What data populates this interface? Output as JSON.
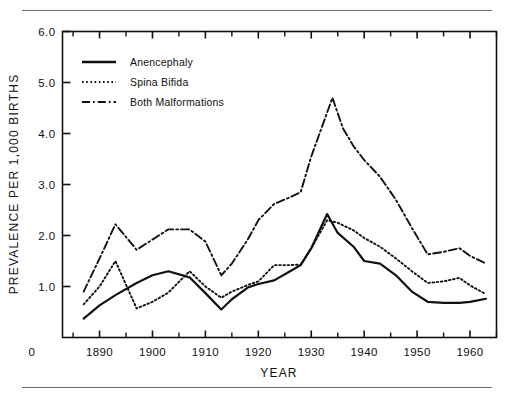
{
  "figure": {
    "background_color": "#ffffff",
    "ink_color": "#111111",
    "rule_color": "#6b6b6b",
    "top_rule": "horizontal-rule",
    "bottom_rule": "horizontal-rule"
  },
  "chart_data": {
    "type": "line",
    "title": "",
    "xlabel": "YEAR",
    "ylabel": "PREVALENCE PER 1,000 BIRTHS",
    "xlim": [
      1883,
      1965
    ],
    "ylim": [
      0,
      6.0
    ],
    "grid": false,
    "legend_position": "top-left",
    "x_tick_labels": [
      "1890",
      "1900",
      "1910",
      "1920",
      "1930",
      "1940",
      "1950",
      "1960"
    ],
    "x_major_ticks": [
      1890,
      1900,
      1910,
      1920,
      1930,
      1940,
      1950,
      1960
    ],
    "x_minor_ticks": [
      1885,
      1895,
      1905,
      1915,
      1925,
      1935,
      1945,
      1955,
      1965
    ],
    "y_tick_labels": [
      "1.0",
      "2.0",
      "3.0",
      "4.0",
      "5.0",
      "6.0"
    ],
    "y_ticks": [
      1.0,
      2.0,
      3.0,
      4.0,
      5.0,
      6.0
    ],
    "origin_label": "0",
    "series": [
      {
        "name": "Anencephaly",
        "style": "solid",
        "x": [
          1887,
          1890,
          1893,
          1897,
          1900,
          1903,
          1907,
          1910,
          1913,
          1915,
          1918,
          1920,
          1923,
          1926,
          1928,
          1930,
          1933,
          1935,
          1938,
          1940,
          1943,
          1946,
          1949,
          1952,
          1955,
          1958,
          1960,
          1963
        ],
        "values": [
          0.37,
          0.63,
          0.83,
          1.07,
          1.22,
          1.3,
          1.18,
          0.87,
          0.55,
          0.75,
          0.98,
          1.05,
          1.12,
          1.3,
          1.42,
          1.75,
          2.42,
          2.05,
          1.78,
          1.5,
          1.45,
          1.22,
          0.9,
          0.7,
          0.68,
          0.68,
          0.7,
          0.76
        ]
      },
      {
        "name": "Spina  Bifida",
        "style": "dotted",
        "x": [
          1887,
          1890,
          1893,
          1897,
          1900,
          1903,
          1907,
          1910,
          1913,
          1915,
          1918,
          1920,
          1923,
          1926,
          1928,
          1930,
          1933,
          1935,
          1938,
          1940,
          1943,
          1946,
          1949,
          1952,
          1955,
          1958,
          1960,
          1963
        ],
        "values": [
          0.65,
          1.0,
          1.5,
          0.57,
          0.7,
          0.88,
          1.3,
          1.0,
          0.78,
          0.9,
          1.03,
          1.1,
          1.42,
          1.42,
          1.43,
          1.75,
          2.3,
          2.25,
          2.1,
          1.95,
          1.78,
          1.55,
          1.3,
          1.07,
          1.1,
          1.17,
          1.02,
          0.85
        ]
      },
      {
        "name": "Both  Malformations",
        "style": "dash-dot",
        "x": [
          1887,
          1890,
          1893,
          1897,
          1900,
          1903,
          1907,
          1910,
          1913,
          1915,
          1918,
          1920,
          1923,
          1926,
          1928,
          1930,
          1934,
          1936,
          1938,
          1940,
          1943,
          1946,
          1949,
          1952,
          1955,
          1958,
          1960,
          1963
        ],
        "values": [
          0.9,
          1.55,
          2.22,
          1.72,
          1.92,
          2.12,
          2.12,
          1.88,
          1.22,
          1.45,
          1.92,
          2.3,
          2.62,
          2.75,
          2.85,
          3.55,
          4.7,
          4.1,
          3.75,
          3.48,
          3.15,
          2.7,
          2.15,
          1.63,
          1.68,
          1.75,
          1.6,
          1.45
        ]
      }
    ]
  },
  "legend": {
    "entries": [
      {
        "label": "Anencephaly",
        "style": "solid"
      },
      {
        "label": "Spina   Bifida",
        "style": "dotted"
      },
      {
        "label": "Both   Malformations",
        "style": "dash-dot"
      }
    ]
  }
}
